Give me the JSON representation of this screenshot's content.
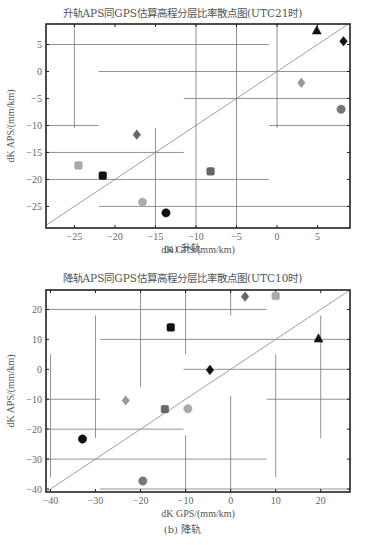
{
  "figure": {
    "top": {
      "title": "升轨APS同GPS估算高程分层比率散点图(UTC21时)",
      "xlabel": "dK GPS/(mm/km)",
      "ylabel": "dK APS/(mm/km)",
      "caption": "(a) 升轨"
    },
    "bottom": {
      "title": "降轨APS同GPS估算高程分层比率散点图(UTC10时)",
      "xlabel": "dK GPS/(mm/km)",
      "ylabel": "dK APS/(mm/km)",
      "caption": "(b) 降轨"
    }
  },
  "chart_data": [
    {
      "type": "scatter",
      "title": "升轨APS同GPS估算高程分层比率散点图(UTC21时)",
      "xlabel": "dK GPS/(mm/km)",
      "ylabel": "dK APS/(mm/km)",
      "xlim": [
        -28.5,
        9
      ],
      "ylim": [
        -29,
        8.8
      ],
      "xticks": [
        -25,
        -20,
        -15,
        -10,
        -5,
        0,
        5
      ],
      "yticks": [
        -25,
        -20,
        -15,
        -10,
        -5,
        0,
        5
      ],
      "reference_line": "y = x",
      "points": [
        {
          "x": 4.9,
          "y": 7.6,
          "marker": "triangle",
          "color": "#111111"
        },
        {
          "x": 8.2,
          "y": 5.6,
          "marker": "diamond",
          "color": "#111111"
        },
        {
          "x": 3.0,
          "y": -2.1,
          "marker": "diamond",
          "color": "#999999"
        },
        {
          "x": 7.9,
          "y": -7.0,
          "marker": "circle",
          "color": "#777777"
        },
        {
          "x": -17.3,
          "y": -11.7,
          "marker": "diamond",
          "color": "#666666"
        },
        {
          "x": -24.5,
          "y": -17.4,
          "marker": "square",
          "color": "#aaaaaa"
        },
        {
          "x": -21.5,
          "y": -19.3,
          "marker": "square",
          "color": "#111111"
        },
        {
          "x": -8.2,
          "y": -18.5,
          "marker": "square",
          "color": "#666666"
        },
        {
          "x": -16.6,
          "y": -24.2,
          "marker": "circle",
          "color": "#aaaaaa"
        },
        {
          "x": -13.7,
          "y": -26.2,
          "marker": "circle",
          "color": "#111111"
        }
      ],
      "error_bars": {
        "horizontal": [
          {
            "y": 5,
            "x1": -28.5,
            "x2": -1
          },
          {
            "y": 0,
            "x1": -22,
            "x2": 9
          },
          {
            "y": -5,
            "x1": -11.5,
            "x2": 9
          },
          {
            "y": -10,
            "x1": -28.5,
            "x2": -22
          },
          {
            "y": -10,
            "x1": -1,
            "x2": 9
          },
          {
            "y": -15,
            "x1": -28.5,
            "x2": -11.5
          },
          {
            "y": -20,
            "x1": -28.5,
            "x2": -1
          },
          {
            "y": -25,
            "x1": -22,
            "x2": 9
          }
        ],
        "vertical": [
          {
            "x": -25,
            "y1": 8.8,
            "y2": -10.5
          },
          {
            "x": -15,
            "y1": -10.5,
            "y2": -29
          },
          {
            "x": -10,
            "y1": 8.8,
            "y2": -29
          },
          {
            "x": -5,
            "y1": 8.8,
            "y2": -29
          },
          {
            "x": 0,
            "y1": 8.8,
            "y2": -10.5
          }
        ]
      }
    },
    {
      "type": "scatter",
      "title": "降轨APS同GPS估算高程分层比率散点图(UTC10时)",
      "xlabel": "dK GPS/(mm/km)",
      "ylabel": "dK APS/(mm/km)",
      "xlim": [
        -41,
        26.5
      ],
      "ylim": [
        -41,
        26.5
      ],
      "xticks": [
        -40,
        -30,
        -20,
        -10,
        0,
        10,
        20
      ],
      "yticks": [
        -40,
        -30,
        -20,
        -10,
        0,
        10,
        20
      ],
      "reference_line": "y = x",
      "points": [
        {
          "x": 3.2,
          "y": 24.3,
          "marker": "diamond",
          "color": "#666666"
        },
        {
          "x": 10.0,
          "y": 24.5,
          "marker": "square",
          "color": "#aaaaaa"
        },
        {
          "x": -13.3,
          "y": 14.0,
          "marker": "square",
          "color": "#111111"
        },
        {
          "x": 19.5,
          "y": 10.3,
          "marker": "triangle",
          "color": "#111111"
        },
        {
          "x": -4.6,
          "y": -0.2,
          "marker": "diamond",
          "color": "#111111"
        },
        {
          "x": -23.3,
          "y": -10.4,
          "marker": "diamond",
          "color": "#999999"
        },
        {
          "x": -14.6,
          "y": -13.3,
          "marker": "square",
          "color": "#666666"
        },
        {
          "x": -9.5,
          "y": -13.2,
          "marker": "circle",
          "color": "#aaaaaa"
        },
        {
          "x": -32.9,
          "y": -23.3,
          "marker": "circle",
          "color": "#111111"
        },
        {
          "x": -19.5,
          "y": -37.3,
          "marker": "circle",
          "color": "#777777"
        }
      ],
      "error_bars": {
        "horizontal": [
          {
            "y": 20,
            "x1": -41,
            "x2": 8
          },
          {
            "y": 10,
            "x1": -29,
            "x2": 26.5
          },
          {
            "y": 0,
            "x1": -10.5,
            "x2": 26.5
          },
          {
            "y": -10,
            "x1": -41,
            "x2": -29
          },
          {
            "y": -10,
            "x1": 8,
            "x2": 26.5
          },
          {
            "y": -20,
            "x1": -41,
            "x2": -10.5
          },
          {
            "y": -30,
            "x1": -41,
            "x2": 8
          },
          {
            "y": -40,
            "x1": -29,
            "x2": 26.5
          }
        ],
        "vertical": [
          {
            "x": -40,
            "y1": 5,
            "y2": -36
          },
          {
            "x": -30,
            "y1": 18,
            "y2": -23
          },
          {
            "x": -20,
            "y1": 26.5,
            "y2": -6
          },
          {
            "x": -10,
            "y1": 26.5,
            "y2": 5
          },
          {
            "x": 0,
            "y1": 26.5,
            "y2": 18
          },
          {
            "x": 0,
            "y1": -9,
            "y2": -41
          },
          {
            "x": 10,
            "y1": 5,
            "y2": -36
          },
          {
            "x": 20,
            "y1": 18,
            "y2": -23
          },
          {
            "x": -10,
            "y1": -22,
            "y2": -41
          }
        ]
      }
    }
  ]
}
